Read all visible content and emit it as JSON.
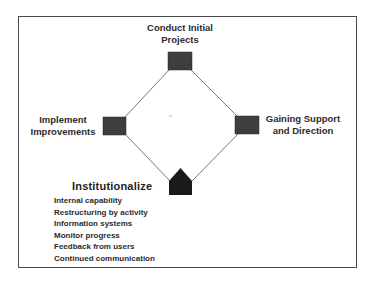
{
  "diagram": {
    "nodes": {
      "top": {
        "label_line1": "Conduct Initial",
        "label_line2": "Projects",
        "shape": "square"
      },
      "right": {
        "label_line1": "Gaining Support",
        "label_line2": "and Direction",
        "shape": "square"
      },
      "left": {
        "label_line1": "Implement",
        "label_line2": "Improvements",
        "shape": "square"
      },
      "bottom": {
        "title": "Institutionalize",
        "shape": "pentagon-house",
        "items": [
          "Internal capability",
          "Restructuring by activity",
          "Information systems",
          "Monitor progress",
          "Feedback from users",
          "Continued communication"
        ]
      }
    },
    "colors": {
      "node_fill": "#3e3e3e",
      "bottom_node_fill": "#1a1a1a",
      "connector": "#6a6a6a",
      "frame": "#4a4a4a"
    }
  }
}
